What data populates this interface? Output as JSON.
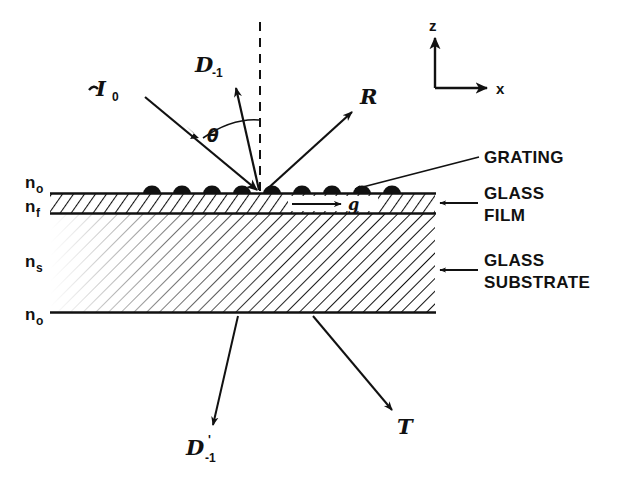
{
  "figure": {
    "background_color": "#ffffff",
    "ink_color": "#111111"
  },
  "beams": {
    "incident": {
      "symbol": "I",
      "subscript": "0",
      "name": "incident-beam"
    },
    "diffracted_up": {
      "symbol": "D",
      "subscript": "-1",
      "name": "diffracted-order-minus-one"
    },
    "reflected": {
      "symbol": "R",
      "subscript": "",
      "name": "reflected-beam"
    },
    "guided": {
      "symbol": "g",
      "subscript": "",
      "name": "guided-wave"
    },
    "diffracted_down": {
      "symbol": "D",
      "prime": "'",
      "subscript": "-1",
      "name": "transmitted-diffracted-order"
    },
    "transmitted": {
      "symbol": "T",
      "subscript": "",
      "name": "transmitted-beam"
    },
    "angle": {
      "symbol": "θ",
      "name": "incidence-angle"
    }
  },
  "indices": [
    {
      "base": "n",
      "sub": "o",
      "region": "ambient-above"
    },
    {
      "base": "n",
      "sub": "f",
      "region": "film"
    },
    {
      "base": "n",
      "sub": "s",
      "region": "substrate"
    },
    {
      "base": "n",
      "sub": "o",
      "region": "ambient-below"
    }
  ],
  "callouts": [
    {
      "text": "GRATING",
      "target": "grating"
    },
    {
      "text": "GLASS",
      "text2": "FILM",
      "target": "glass-film"
    },
    {
      "text": "GLASS",
      "text2": "SUBSTRATE",
      "target": "glass-substrate"
    }
  ],
  "axes": {
    "vertical": "z",
    "horizontal": "x"
  },
  "grating": {
    "bump_count": 9,
    "bump_color": "#111111"
  }
}
